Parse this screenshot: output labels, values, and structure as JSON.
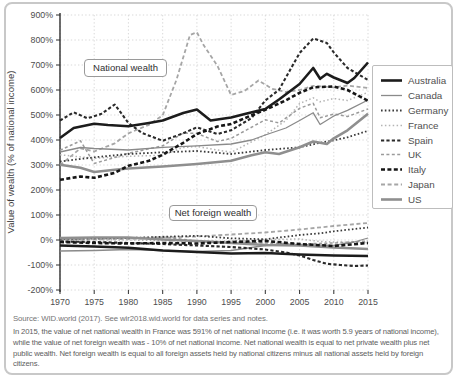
{
  "page": {
    "background": "#ffffff",
    "card_border_color": "#c8c8c8"
  },
  "chart_data": {
    "type": "line",
    "title": "",
    "xlabel": "",
    "ylabel": "Value of wealth (% of national income)",
    "xlim": [
      1970,
      2015
    ],
    "ylim": [
      -200,
      900
    ],
    "x_ticks": [
      1970,
      1975,
      1980,
      1985,
      1990,
      1995,
      2000,
      2005,
      2010,
      2015
    ],
    "y_ticks": [
      -200,
      -100,
      0,
      100,
      200,
      300,
      400,
      500,
      600,
      700,
      800,
      900
    ],
    "y_tick_suffix": "%",
    "grid": true,
    "legend_position": "right",
    "annotations": [
      {
        "label": "National wealth"
      },
      {
        "label": "Net foreign wealth"
      }
    ],
    "series": [
      {
        "name": "Australia",
        "color": "#1c1c1c",
        "width": 2.6,
        "dash": "",
        "national_wealth": [
          [
            1970,
            408
          ],
          [
            1972,
            448
          ],
          [
            1975,
            465
          ],
          [
            1977,
            460
          ],
          [
            1980,
            455
          ],
          [
            1983,
            468
          ],
          [
            1985,
            478
          ],
          [
            1988,
            508
          ],
          [
            1990,
            522
          ],
          [
            1992,
            478
          ],
          [
            1994,
            486
          ],
          [
            1995,
            490
          ],
          [
            1997,
            504
          ],
          [
            2000,
            524
          ],
          [
            2002,
            562
          ],
          [
            2005,
            624
          ],
          [
            2007,
            688
          ],
          [
            2008,
            645
          ],
          [
            2009,
            665
          ],
          [
            2010,
            650
          ],
          [
            2012,
            628
          ],
          [
            2013,
            648
          ],
          [
            2015,
            710
          ]
        ],
        "net_foreign_wealth": [
          [
            1970,
            -22
          ],
          [
            1975,
            -26
          ],
          [
            1980,
            -31
          ],
          [
            1985,
            -42
          ],
          [
            1990,
            -48
          ],
          [
            1995,
            -54
          ],
          [
            2000,
            -52
          ],
          [
            2005,
            -58
          ],
          [
            2010,
            -62
          ],
          [
            2015,
            -64
          ]
        ]
      },
      {
        "name": "Canada",
        "color": "#8a8a8a",
        "width": 1.3,
        "dash": "",
        "national_wealth": [
          [
            1970,
            352
          ],
          [
            1973,
            370
          ],
          [
            1975,
            366
          ],
          [
            1980,
            360
          ],
          [
            1985,
            371
          ],
          [
            1990,
            377
          ],
          [
            1995,
            384
          ],
          [
            1998,
            400
          ],
          [
            2000,
            420
          ],
          [
            2003,
            448
          ],
          [
            2005,
            478
          ],
          [
            2007,
            509
          ],
          [
            2008,
            462
          ],
          [
            2010,
            496
          ],
          [
            2012,
            519
          ],
          [
            2015,
            560
          ]
        ],
        "net_foreign_wealth": [
          [
            1970,
            -44
          ],
          [
            1975,
            -42
          ],
          [
            1980,
            -38
          ],
          [
            1985,
            -42
          ],
          [
            1990,
            -46
          ],
          [
            1995,
            -42
          ],
          [
            2000,
            -22
          ],
          [
            2005,
            -18
          ],
          [
            2010,
            -22
          ],
          [
            2013,
            -8
          ],
          [
            2015,
            8
          ]
        ]
      },
      {
        "name": "Germany",
        "color": "#3a3a3a",
        "width": 1.8,
        "dash": "1.6,2.2",
        "national_wealth": [
          [
            1970,
            314
          ],
          [
            1975,
            331
          ],
          [
            1980,
            344
          ],
          [
            1985,
            351
          ],
          [
            1990,
            356
          ],
          [
            1995,
            344
          ],
          [
            2000,
            360
          ],
          [
            2005,
            371
          ],
          [
            2008,
            389
          ],
          [
            2010,
            399
          ],
          [
            2012,
            411
          ],
          [
            2015,
            437
          ]
        ],
        "net_foreign_wealth": [
          [
            1970,
            5
          ],
          [
            1975,
            7
          ],
          [
            1980,
            8
          ],
          [
            1985,
            13
          ],
          [
            1990,
            17
          ],
          [
            1995,
            7
          ],
          [
            2000,
            3
          ],
          [
            2005,
            20
          ],
          [
            2008,
            27
          ],
          [
            2010,
            35
          ],
          [
            2015,
            50
          ]
        ]
      },
      {
        "name": "France",
        "color": "#b4b4b4",
        "width": 1.5,
        "dash": "1.5,2.4",
        "national_wealth": [
          [
            1970,
            341
          ],
          [
            1975,
            327
          ],
          [
            1980,
            335
          ],
          [
            1985,
            339
          ],
          [
            1988,
            370
          ],
          [
            1990,
            374
          ],
          [
            1995,
            351
          ],
          [
            2000,
            421
          ],
          [
            2003,
            478
          ],
          [
            2005,
            546
          ],
          [
            2007,
            569
          ],
          [
            2008,
            553
          ],
          [
            2010,
            566
          ],
          [
            2012,
            558
          ],
          [
            2015,
            591
          ]
        ],
        "net_foreign_wealth": [
          [
            1970,
            2
          ],
          [
            1975,
            2
          ],
          [
            1980,
            0
          ],
          [
            1985,
            -2
          ],
          [
            1990,
            -6
          ],
          [
            1995,
            -4
          ],
          [
            2000,
            2
          ],
          [
            2005,
            4
          ],
          [
            2008,
            -6
          ],
          [
            2010,
            -8
          ],
          [
            2015,
            -10
          ]
        ]
      },
      {
        "name": "Spain",
        "color": "#2a2a2a",
        "width": 2.1,
        "dash": "3.2,2.2",
        "national_wealth": [
          [
            1970,
            478
          ],
          [
            1972,
            511
          ],
          [
            1974,
            487
          ],
          [
            1976,
            504
          ],
          [
            1978,
            542
          ],
          [
            1980,
            468
          ],
          [
            1982,
            428
          ],
          [
            1985,
            397
          ],
          [
            1988,
            427
          ],
          [
            1990,
            451
          ],
          [
            1993,
            424
          ],
          [
            1995,
            439
          ],
          [
            1998,
            488
          ],
          [
            2000,
            558
          ],
          [
            2002,
            601
          ],
          [
            2005,
            748
          ],
          [
            2007,
            806
          ],
          [
            2009,
            788
          ],
          [
            2010,
            750
          ],
          [
            2012,
            688
          ],
          [
            2015,
            640
          ]
        ],
        "net_foreign_wealth": [
          [
            1970,
            -6
          ],
          [
            1975,
            -8
          ],
          [
            1980,
            -12
          ],
          [
            1985,
            -16
          ],
          [
            1990,
            -22
          ],
          [
            1995,
            -28
          ],
          [
            2000,
            -38
          ],
          [
            2003,
            -50
          ],
          [
            2005,
            -62
          ],
          [
            2007,
            -80
          ],
          [
            2009,
            -95
          ],
          [
            2011,
            -100
          ],
          [
            2013,
            -104
          ],
          [
            2015,
            -102
          ]
        ]
      },
      {
        "name": "UK",
        "color": "#9b9b9b",
        "width": 1.5,
        "dash": "3,2.4",
        "national_wealth": [
          [
            1970,
            359
          ],
          [
            1973,
            397
          ],
          [
            1975,
            306
          ],
          [
            1978,
            330
          ],
          [
            1980,
            347
          ],
          [
            1985,
            377
          ],
          [
            1988,
            428
          ],
          [
            1990,
            426
          ],
          [
            1993,
            394
          ],
          [
            1995,
            407
          ],
          [
            2000,
            481
          ],
          [
            2002,
            468
          ],
          [
            2005,
            527
          ],
          [
            2007,
            547
          ],
          [
            2008,
            489
          ],
          [
            2010,
            504
          ],
          [
            2012,
            494
          ],
          [
            2015,
            524
          ]
        ],
        "net_foreign_wealth": [
          [
            1970,
            2
          ],
          [
            1975,
            4
          ],
          [
            1980,
            8
          ],
          [
            1985,
            12
          ],
          [
            1990,
            -4
          ],
          [
            1995,
            -8
          ],
          [
            2000,
            -12
          ],
          [
            2005,
            -16
          ],
          [
            2010,
            -12
          ],
          [
            2015,
            -4
          ]
        ]
      },
      {
        "name": "Italy",
        "color": "#161616",
        "width": 2.6,
        "dash": "4,2.4",
        "national_wealth": [
          [
            1970,
            241
          ],
          [
            1973,
            254
          ],
          [
            1975,
            249
          ],
          [
            1978,
            269
          ],
          [
            1980,
            297
          ],
          [
            1983,
            317
          ],
          [
            1985,
            341
          ],
          [
            1988,
            389
          ],
          [
            1990,
            424
          ],
          [
            1993,
            454
          ],
          [
            1995,
            464
          ],
          [
            1998,
            499
          ],
          [
            2000,
            521
          ],
          [
            2003,
            559
          ],
          [
            2005,
            589
          ],
          [
            2007,
            611
          ],
          [
            2010,
            614
          ],
          [
            2012,
            600
          ],
          [
            2015,
            557
          ]
        ],
        "net_foreign_wealth": [
          [
            1970,
            -8
          ],
          [
            1975,
            -12
          ],
          [
            1980,
            -14
          ],
          [
            1985,
            -12
          ],
          [
            1990,
            -14
          ],
          [
            1995,
            -8
          ],
          [
            2000,
            -4
          ],
          [
            2005,
            -16
          ],
          [
            2010,
            -24
          ],
          [
            2015,
            -12
          ]
        ]
      },
      {
        "name": "Japan",
        "color": "#a6a6a6",
        "width": 1.8,
        "dash": "4,2.6",
        "national_wealth": [
          [
            1970,
            299
          ],
          [
            1973,
            367
          ],
          [
            1975,
            354
          ],
          [
            1978,
            387
          ],
          [
            1980,
            427
          ],
          [
            1983,
            461
          ],
          [
            1985,
            499
          ],
          [
            1987,
            640
          ],
          [
            1989,
            820
          ],
          [
            1990,
            831
          ],
          [
            1991,
            779
          ],
          [
            1993,
            697
          ],
          [
            1995,
            580
          ],
          [
            1997,
            597
          ],
          [
            1999,
            638
          ],
          [
            2001,
            605
          ],
          [
            2003,
            592
          ],
          [
            2005,
            600
          ],
          [
            2007,
            617
          ],
          [
            2010,
            611
          ],
          [
            2012,
            618
          ],
          [
            2015,
            608
          ]
        ],
        "net_foreign_wealth": [
          [
            1970,
            0
          ],
          [
            1975,
            2
          ],
          [
            1980,
            4
          ],
          [
            1985,
            10
          ],
          [
            1990,
            14
          ],
          [
            1995,
            22
          ],
          [
            2000,
            30
          ],
          [
            2005,
            42
          ],
          [
            2010,
            56
          ],
          [
            2015,
            68
          ]
        ]
      },
      {
        "name": "US",
        "color": "#8f8f8f",
        "width": 2.6,
        "dash": "",
        "national_wealth": [
          [
            1970,
            301
          ],
          [
            1973,
            289
          ],
          [
            1975,
            272
          ],
          [
            1978,
            281
          ],
          [
            1980,
            286
          ],
          [
            1985,
            294
          ],
          [
            1990,
            304
          ],
          [
            1995,
            317
          ],
          [
            1998,
            339
          ],
          [
            2000,
            351
          ],
          [
            2002,
            344
          ],
          [
            2005,
            371
          ],
          [
            2007,
            394
          ],
          [
            2009,
            384
          ],
          [
            2010,
            407
          ],
          [
            2012,
            439
          ],
          [
            2015,
            505
          ]
        ],
        "net_foreign_wealth": [
          [
            1970,
            8
          ],
          [
            1975,
            10
          ],
          [
            1980,
            10
          ],
          [
            1985,
            2
          ],
          [
            1990,
            -4
          ],
          [
            1995,
            -12
          ],
          [
            2000,
            -20
          ],
          [
            2005,
            -22
          ],
          [
            2010,
            -30
          ],
          [
            2015,
            -36
          ]
        ]
      }
    ]
  },
  "caption": {
    "source": "Source: WID.world (2017). See wir2018.wid.world for data series and notes.",
    "note": "In 2015, the value of net national wealth in France was 591% of net national income (i.e. it was worth 5.9 years of national income), while the value of net foreign wealth was - 10% of net national income. Net national wealth is equal to net private wealth plus net public wealth. Net foreign wealth is equal to all foreign assets held by national citizens minus all national assets held by foreign citizens."
  }
}
